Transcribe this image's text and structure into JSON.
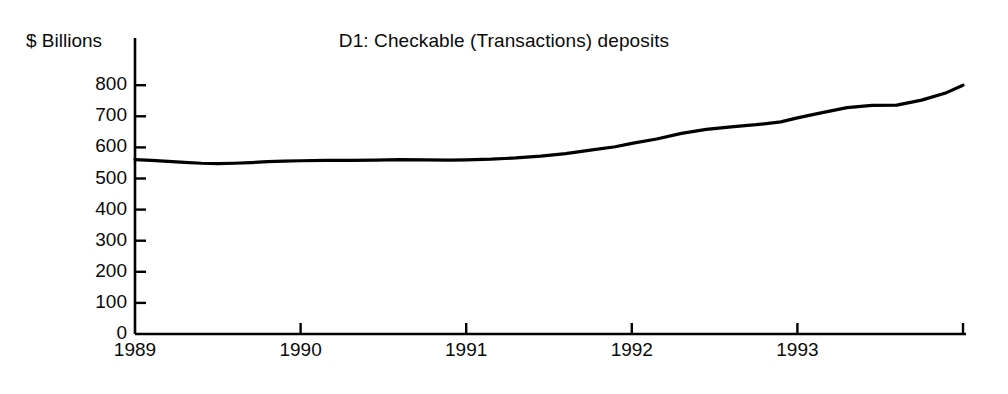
{
  "chart_data": {
    "type": "line",
    "title": "D1: Checkable (Transactions) deposits",
    "ylabel": "$ Billions",
    "xlabel": "",
    "ylim": [
      0,
      840
    ],
    "xlim": [
      1989.0,
      1994.0
    ],
    "yticks": [
      0,
      100,
      200,
      300,
      400,
      500,
      600,
      700,
      800
    ],
    "ytick_labels": [
      "0",
      "100",
      "200",
      "300",
      "400",
      "500",
      "600",
      "700",
      "800"
    ],
    "xticks": [
      1989,
      1990,
      1991,
      1992,
      1993
    ],
    "xtick_labels": [
      "1989",
      "1990",
      "1991",
      "1992",
      "1993"
    ],
    "grid": false,
    "legend": null,
    "line_color": "#000000",
    "line_width_px": 3.2,
    "series": [
      {
        "name": "Checkable (Transactions) deposits",
        "x": [
          1989.0,
          1989.1,
          1989.2,
          1989.3,
          1989.4,
          1989.5,
          1989.6,
          1989.7,
          1989.8,
          1989.9,
          1990.0,
          1990.15,
          1990.3,
          1990.45,
          1990.6,
          1990.75,
          1990.9,
          1991.0,
          1991.15,
          1991.3,
          1991.45,
          1991.6,
          1991.75,
          1991.9,
          1992.0,
          1992.15,
          1992.3,
          1992.45,
          1992.6,
          1992.75,
          1992.9,
          1993.0,
          1993.15,
          1993.3,
          1993.45,
          1993.6,
          1993.75,
          1993.9,
          1994.0
        ],
        "values": [
          561,
          558,
          555,
          552,
          549,
          548,
          549,
          551,
          554,
          556,
          557,
          558,
          558,
          559,
          561,
          560,
          559,
          560,
          562,
          566,
          572,
          580,
          591,
          602,
          613,
          627,
          645,
          658,
          666,
          673,
          682,
          695,
          712,
          728,
          735,
          736,
          752,
          776,
          800
        ]
      }
    ]
  }
}
